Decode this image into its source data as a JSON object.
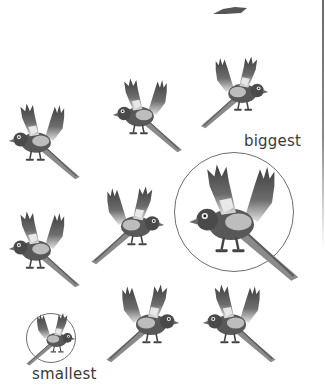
{
  "worksheet": {
    "labels": {
      "biggest": "biggest",
      "smallest": "smallest"
    },
    "birds": [
      {
        "id": "bird-top-fragment",
        "size": "partial",
        "facing": "left"
      },
      {
        "id": "bird-row1-right",
        "size": "medium",
        "facing": "right"
      },
      {
        "id": "bird-row1-mid",
        "size": "medium",
        "facing": "left"
      },
      {
        "id": "bird-row2-left",
        "size": "medium",
        "facing": "left"
      },
      {
        "id": "bird-row2-mid",
        "size": "medium",
        "facing": "right"
      },
      {
        "id": "bird-biggest",
        "size": "biggest",
        "facing": "left",
        "circled": true
      },
      {
        "id": "bird-row3-left",
        "size": "medium",
        "facing": "left"
      },
      {
        "id": "bird-smallest",
        "size": "smallest",
        "facing": "right",
        "circled": true
      },
      {
        "id": "bird-row4-mid",
        "size": "medium",
        "facing": "right"
      },
      {
        "id": "bird-row4-right",
        "size": "medium",
        "facing": "left"
      }
    ],
    "colors": {
      "bird_dark": "#4a4a4a",
      "bird_mid": "#7a7a7a",
      "bird_light": "#d8d8d8",
      "circle": "#6f6f6f",
      "text": "#3a3a3a"
    }
  }
}
